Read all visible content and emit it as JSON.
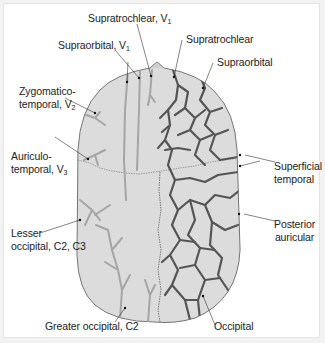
{
  "figure": {
    "colors": {
      "background": "#ffffff",
      "frame_border": "#e4e4e4",
      "skull_fill": "#dcdcdc",
      "skull_outline": "#555555",
      "nerve_color": "#9a9a9a",
      "artery_color": "#505050",
      "label_text": "#222222"
    },
    "nerve_labels": {
      "supratrochlear_v1": {
        "text": "Supratrochlear, V",
        "sub": "1"
      },
      "supraorbital_v1": {
        "text": "Supraorbital, V",
        "sub": "1"
      },
      "zygomatico_line1": "Zygomatico-",
      "zygomatico_line2": {
        "text": "temporal, V",
        "sub": "2"
      },
      "auriculo_line1": "Auriculo-",
      "auriculo_line2": {
        "text": "temporal, V",
        "sub": "3"
      },
      "lesser_line1": "Lesser",
      "lesser_line2": "occipital, C2, C3",
      "greater_occipital": "Greater occipital, C2"
    },
    "artery_labels": {
      "supratrochlear": "Supratrochlear",
      "supraorbital": "Supraorbital",
      "superficial_line1": "Superficial",
      "superficial_line2": "temporal",
      "posterior_line1": "Posterior",
      "posterior_line2": "auricular",
      "occipital": "Occipital"
    }
  }
}
